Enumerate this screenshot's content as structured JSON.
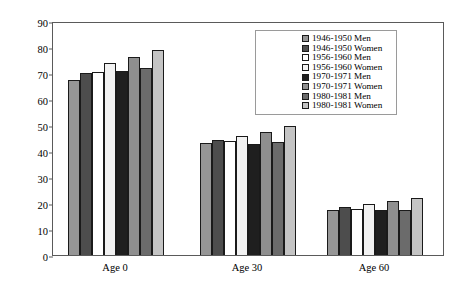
{
  "chart_data": {
    "type": "bar",
    "title": "",
    "subtitle": "",
    "xlabel": "",
    "ylabel": "Further life expectancy in years",
    "ylim": [
      0,
      90
    ],
    "yticks": [
      0,
      10,
      20,
      30,
      40,
      50,
      60,
      70,
      80,
      90
    ],
    "grid": false,
    "legend_position": "top-right",
    "categories": [
      "Age 0",
      "Age 30",
      "Age 60"
    ],
    "series": [
      {
        "name": "1946-1950 Men",
        "color": "#969696",
        "values": [
          67.5,
          43.0,
          17.5
        ]
      },
      {
        "name": "1946-1950 Women",
        "color": "#4d4d4d",
        "values": [
          70.0,
          44.3,
          18.3
        ]
      },
      {
        "name": "1956-1960 Men",
        "color": "#ffffff",
        "values": [
          70.3,
          43.8,
          17.8
        ]
      },
      {
        "name": "1956-1960 Women",
        "color": "#f2f2f2",
        "values": [
          73.7,
          45.8,
          19.5
        ]
      },
      {
        "name": "1970-1971 Men",
        "color": "#1f1f1f",
        "values": [
          70.8,
          42.8,
          17.2
        ]
      },
      {
        "name": "1970-1971 Women",
        "color": "#8f8f8f",
        "values": [
          76.0,
          47.5,
          20.8
        ]
      },
      {
        "name": "1980-1981 Men",
        "color": "#6b6b6b",
        "values": [
          71.9,
          43.3,
          17.5
        ]
      },
      {
        "name": "1980-1981 Women",
        "color": "#c4c4c4",
        "values": [
          78.7,
          49.5,
          21.8
        ]
      }
    ]
  },
  "axis": {
    "y_title": "Further life expectancy in years",
    "y_tick_labels": [
      "90",
      "80",
      "70",
      "60",
      "50",
      "40",
      "30",
      "20",
      "10",
      "0"
    ],
    "x_tick_labels": [
      "Age 0",
      "Age 30",
      "Age 60"
    ]
  },
  "legend": {
    "entries": [
      {
        "label": "1946-1950 Men"
      },
      {
        "label": "1946-1950 Women"
      },
      {
        "label": "1956-1960 Men"
      },
      {
        "label": "1956-1960 Women"
      },
      {
        "label": "1970-1971 Men"
      },
      {
        "label": "1970-1971 Women"
      },
      {
        "label": "1980-1981 Men"
      },
      {
        "label": "1980-1981 Women"
      }
    ]
  },
  "colors": {
    "frame": "#5a5a5a",
    "bar_outline": "#1a1a1a",
    "background": "#ffffff",
    "text": "#000000"
  }
}
